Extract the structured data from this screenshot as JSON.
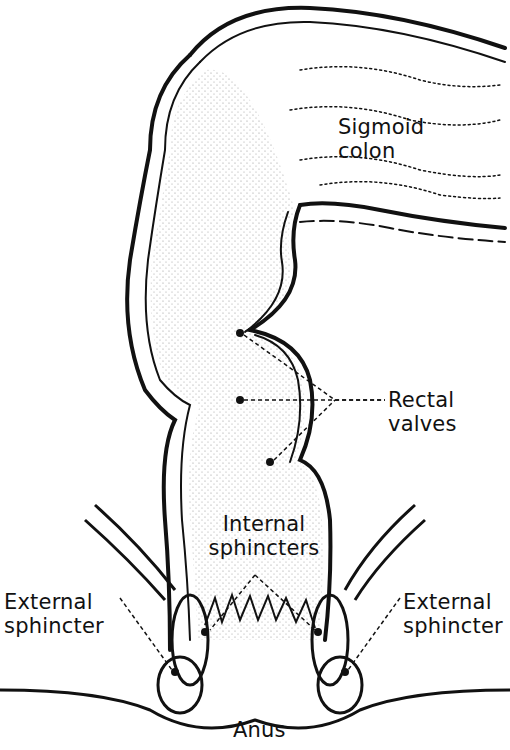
{
  "figure": {
    "type": "anatomical-diagram",
    "colors": {
      "ink": "#111111",
      "background": "#ffffff"
    }
  },
  "labels": {
    "sigmoid_colon": {
      "line1": "Sigmoid",
      "line2": "colon"
    },
    "rectal_valves": {
      "line1": "Rectal",
      "line2": "valves"
    },
    "internal_sphincters": {
      "line1": "Internal",
      "line2": "sphincters"
    },
    "external_sphincter_left": {
      "line1": "External",
      "line2": "sphincter"
    },
    "external_sphincter_right": {
      "line1": "External",
      "line2": "sphincter"
    },
    "anus": "Anus"
  }
}
